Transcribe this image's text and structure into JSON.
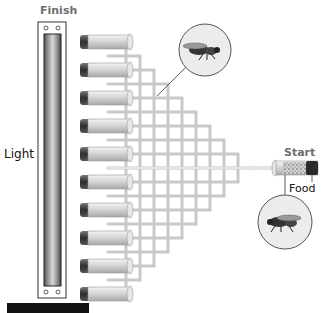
{
  "diagram": {
    "labels": {
      "finish": "Finish",
      "light": "Light",
      "start": "Start",
      "food": "Food"
    },
    "components": {
      "light_source": "light-tube",
      "collection_tubes_count": 10,
      "start_tube": "start-tube-with-food",
      "maze": "branching-tube-network",
      "insets": [
        "fly-magnified-in-maze",
        "fly-magnified-at-start"
      ]
    },
    "colors": {
      "tube_fill": "#d9d9d9",
      "tube_cap": "#3a3a3a",
      "maze_line": "#c8c8c8",
      "label_grey": "#6e6e6e",
      "light_bar_dark": "#555555"
    }
  }
}
